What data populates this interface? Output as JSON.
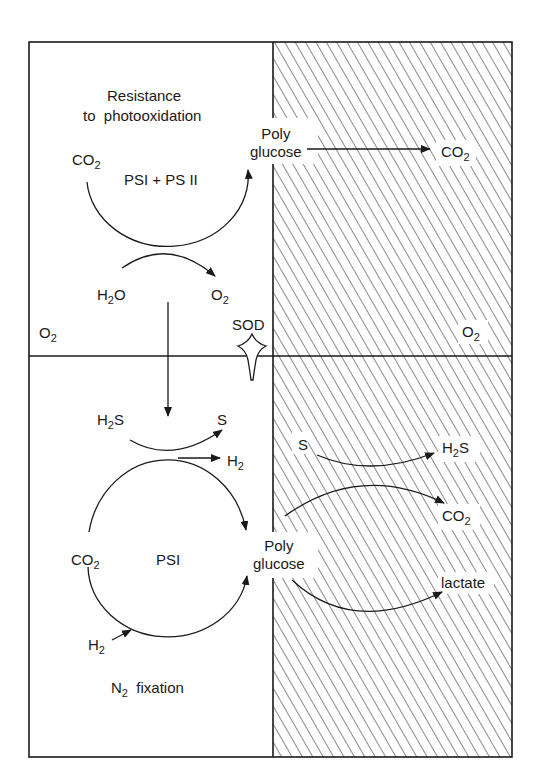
{
  "diagram": {
    "title_top": "Resistance to photooxidation",
    "title_top_line1": "Resistance",
    "title_top_line2": "to  photooxidation",
    "title_bottom": "N2 fixation",
    "regions": {
      "upper_left": "aerobic light",
      "upper_right": "aerobic dark (hatched)",
      "lower_left": "anaerobic light",
      "lower_right": "anaerobic dark (hatched)"
    },
    "upper": {
      "co2": "CO",
      "co2_sub": "2",
      "photosystem": "PSI + PS II",
      "polyglucose_line1": "Poly",
      "polyglucose_line2": "glucose",
      "co2_out": "CO",
      "co2_out_sub": "2",
      "h2o": "H",
      "h2o_sub": "2",
      "h2o_tail": "O",
      "o2": "O",
      "o2_sub": "2",
      "o2_left": "O",
      "o2_left_sub": "2",
      "o2_right": "O",
      "o2_right_sub": "2",
      "sod": "SOD"
    },
    "lower": {
      "h2s": "H",
      "h2s_sub": "2",
      "h2s_tail": "S",
      "s": "S",
      "h2": "H",
      "h2_sub": "2",
      "co2": "CO",
      "co2_sub": "2",
      "photosystem": "PSI",
      "h2_in": "H",
      "h2_in_sub": "2",
      "polyglucose_line1": "Poly",
      "polyglucose_line2": "glucose",
      "dark_s": "S",
      "dark_h2s": "H",
      "dark_h2s_sub": "2",
      "dark_h2s_tail": "S",
      "dark_co2": "CO",
      "dark_co2_sub": "2",
      "lactate": "lactate",
      "n2": "N",
      "n2_sub": "2",
      "fixation": "fixation"
    },
    "colors": {
      "line": "#1a1a1a",
      "hatch": "#2a2a2a",
      "background": "#ffffff"
    }
  }
}
